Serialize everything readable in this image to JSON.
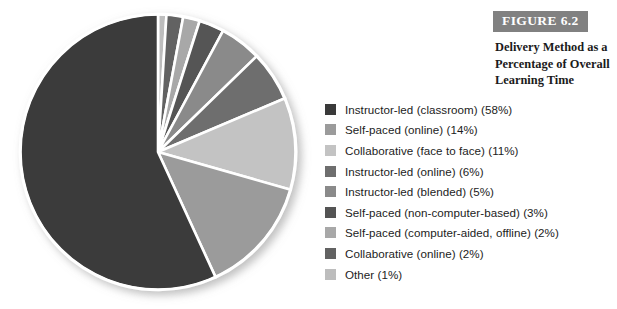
{
  "figure": {
    "badge": "FIGURE 6.2",
    "caption": "Delivery Method as a Percentage of Overall Learning Time",
    "badge_bg": "#818181",
    "badge_text_color": "#ffffff"
  },
  "chart_data": {
    "type": "pie",
    "title": "Delivery Method as a Percentage of Overall Learning Time",
    "xlabel": "",
    "ylabel": "",
    "legend_position": "right",
    "grid": false,
    "start_angle_deg": 0,
    "direction": "clockwise",
    "slice_border_color": "#ffffff",
    "categories": [
      "Instructor-led (classroom)",
      "Self-paced (online)",
      "Collaborative (face to face)",
      "Instructor-led (online)",
      "Instructor-led (blended)",
      "Self-paced (non-computer-based)",
      "Self-paced (computer-aided, offline)",
      "Collaborative (online)",
      "Other"
    ],
    "values": [
      58,
      14,
      11,
      6,
      5,
      3,
      2,
      2,
      1
    ],
    "units": "percent",
    "colors": [
      "#3a3a3a",
      "#9b9b9b",
      "#c3c3c3",
      "#6e6e6e",
      "#8a8a8a",
      "#545454",
      "#a8a8a8",
      "#626262",
      "#bdbdbd"
    ],
    "draw_order": [
      {
        "category": "Other",
        "value": 1,
        "color": "#bdbdbd"
      },
      {
        "category": "Collaborative (online)",
        "value": 2,
        "color": "#626262"
      },
      {
        "category": "Self-paced (computer-aided, offline)",
        "value": 2,
        "color": "#a8a8a8"
      },
      {
        "category": "Self-paced (non-computer-based)",
        "value": 3,
        "color": "#545454"
      },
      {
        "category": "Instructor-led (blended)",
        "value": 5,
        "color": "#8a8a8a"
      },
      {
        "category": "Instructor-led (online)",
        "value": 6,
        "color": "#6e6e6e"
      },
      {
        "category": "Collaborative (face to face)",
        "value": 11,
        "color": "#c3c3c3"
      },
      {
        "category": "Self-paced (online)",
        "value": 14,
        "color": "#9b9b9b"
      },
      {
        "category": "Instructor-led (classroom)",
        "value": 58,
        "color": "#3a3a3a"
      }
    ]
  },
  "legend": {
    "items": [
      {
        "label": "Instructor-led (classroom) (58%)",
        "color": "#3a3a3a"
      },
      {
        "label": "Self-paced (online) (14%)",
        "color": "#9b9b9b"
      },
      {
        "label": "Collaborative (face to face) (11%)",
        "color": "#c3c3c3"
      },
      {
        "label": "Instructor-led (online) (6%)",
        "color": "#6e6e6e"
      },
      {
        "label": "Instructor-led (blended) (5%)",
        "color": "#8a8a8a"
      },
      {
        "label": "Self-paced (non-computer-based) (3%)",
        "color": "#545454"
      },
      {
        "label": "Self-paced (computer-aided, offline) (2%)",
        "color": "#a8a8a8"
      },
      {
        "label": "Collaborative (online) (2%)",
        "color": "#626262"
      },
      {
        "label": "Other (1%)",
        "color": "#bdbdbd"
      }
    ]
  }
}
